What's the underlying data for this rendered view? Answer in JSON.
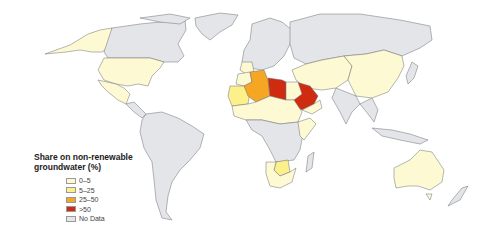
{
  "legend": {
    "title_line1": "Share on non-renewable",
    "title_line2": "groundwater (%)",
    "items": [
      {
        "label": "0–5",
        "color": "#fdf9d3"
      },
      {
        "label": "5–25",
        "color": "#fbf08a"
      },
      {
        "label": "25–50",
        "color": "#f5a623"
      },
      {
        "label": ">50",
        "color": "#cf2b10"
      },
      {
        "label": "No Data",
        "color": "#e3e5e8"
      }
    ]
  },
  "colors": {
    "c0_5": "#fdf9d3",
    "c5_25": "#fbf08a",
    "c25_50": "#f5a623",
    "c50": "#cf2b10",
    "nodata": "#e3e5e8",
    "border": "#6d6f73"
  },
  "map_regions": [
    {
      "region": "Alaska / USA",
      "category": "0–5"
    },
    {
      "region": "Canada",
      "category": "No Data"
    },
    {
      "region": "Greenland",
      "category": "No Data"
    },
    {
      "region": "United States",
      "category": "0–5"
    },
    {
      "region": "Mexico",
      "category": "0–5"
    },
    {
      "region": "Central America & Caribbean",
      "category": "No Data"
    },
    {
      "region": "South America",
      "category": "No Data"
    },
    {
      "region": "Europe",
      "category": "No Data"
    },
    {
      "region": "Russia",
      "category": "No Data"
    },
    {
      "region": "Morocco",
      "category": "0–5"
    },
    {
      "region": "Western Sahara / Mauritania",
      "category": "5–25"
    },
    {
      "region": "Algeria",
      "category": "25–50"
    },
    {
      "region": "Tunisia",
      "category": "0–5"
    },
    {
      "region": "Libya",
      "category": ">50"
    },
    {
      "region": "Egypt",
      "category": "0–5"
    },
    {
      "region": "Sahel (Mali, Niger, Chad, Sudan)",
      "category": "0–5"
    },
    {
      "region": "Saudi Arabia",
      "category": ">50"
    },
    {
      "region": "Yemen / Oman",
      "category": "0–5"
    },
    {
      "region": "Central & Southern Africa",
      "category": "No Data"
    },
    {
      "region": "Botswana",
      "category": "5–25"
    },
    {
      "region": "South Africa / Namibia",
      "category": "0–5"
    },
    {
      "region": "Central Asia / Middle East",
      "category": "0–5"
    },
    {
      "region": "China / Mongolia",
      "category": "0–5"
    },
    {
      "region": "India",
      "category": "No Data"
    },
    {
      "region": "Southeast Asia",
      "category": "No Data"
    },
    {
      "region": "Australia",
      "category": "0–5"
    },
    {
      "region": "New Zealand",
      "category": "No Data"
    }
  ]
}
